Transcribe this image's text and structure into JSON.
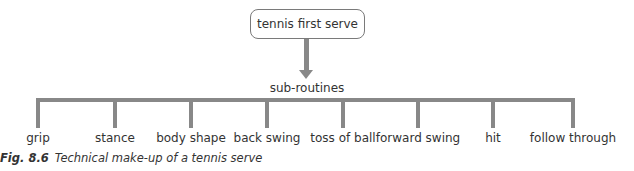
{
  "diagram": {
    "root": {
      "label": "tennis first serve"
    },
    "connector_label": "sub-routines",
    "branches": [
      {
        "label": "grip",
        "x": 38
      },
      {
        "label": "stance",
        "x": 115
      },
      {
        "label": "body shape",
        "x": 191
      },
      {
        "label": "back swing",
        "x": 267
      },
      {
        "label": "toss of ball",
        "x": 343
      },
      {
        "label": "forward swing",
        "x": 418
      },
      {
        "label": "hit",
        "x": 493
      },
      {
        "label": "follow through",
        "x": 573
      }
    ],
    "line_color": "#888888"
  },
  "caption": {
    "number": "Fig. 8.6",
    "text": "Technical make-up of a tennis serve"
  }
}
